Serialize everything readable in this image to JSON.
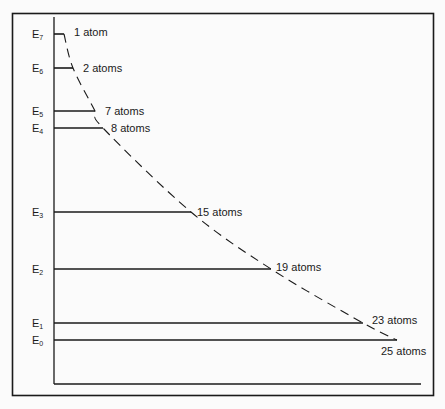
{
  "diagram": {
    "type": "energy-level-diagram",
    "levels": [
      {
        "name": "E",
        "sub": "7",
        "y": 34,
        "x_end": 64,
        "label": "1 atom",
        "atoms": 1
      },
      {
        "name": "E",
        "sub": "6",
        "y": 68,
        "x_end": 73,
        "label": "2 atoms",
        "atoms": 2
      },
      {
        "name": "E",
        "sub": "5",
        "y": 111,
        "x_end": 95,
        "label": "7 atoms",
        "atoms": 7
      },
      {
        "name": "E",
        "sub": "4",
        "y": 128,
        "x_end": 103,
        "label": "8 atoms",
        "atoms": 8
      },
      {
        "name": "E",
        "sub": "3",
        "y": 212,
        "x_end": 191,
        "label": "15 atoms",
        "atoms": 15
      },
      {
        "name": "E",
        "sub": "2",
        "y": 269,
        "x_end": 271,
        "label": "19 atoms",
        "atoms": 19
      },
      {
        "name": "E",
        "sub": "1",
        "y": 323,
        "x_end": 363,
        "label": "23 atoms",
        "atoms": 23
      },
      {
        "name": "E",
        "sub": "0",
        "y": 340,
        "x_end": 397,
        "label": "25 atoms",
        "atoms": 25
      }
    ],
    "curve_style": "dashed",
    "colors": {
      "line": "#1a1a1a",
      "background": "#fbfbfb"
    }
  }
}
